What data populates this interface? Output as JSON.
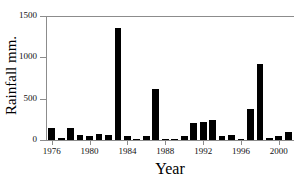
{
  "chart_data": {
    "type": "bar",
    "title": "",
    "xlabel": "Year",
    "ylabel": "Rainfall mm.",
    "xlim": [
      1975.4,
      2001.6
    ],
    "ylim": [
      0,
      1500
    ],
    "grid": false,
    "legend": null,
    "yticks": [
      0,
      500,
      1000,
      1500
    ],
    "ytick_labels": [
      "0",
      "500",
      "1000",
      "1500"
    ],
    "xticks": [
      1976,
      1980,
      1984,
      1988,
      1992,
      1996,
      2000
    ],
    "xtick_labels": [
      "1976",
      "1980",
      "1984",
      "1988",
      "1992",
      "1996",
      "2000"
    ],
    "bar_color": "#000000",
    "axis_color": "#8c8c8c",
    "categories": [
      1976,
      1977,
      1978,
      1979,
      1980,
      1981,
      1982,
      1983,
      1984,
      1985,
      1986,
      1987,
      1988,
      1989,
      1990,
      1991,
      1992,
      1993,
      1994,
      1995,
      1996,
      1997,
      1998,
      1999,
      2000,
      2001
    ],
    "values": [
      145,
      25,
      150,
      65,
      45,
      70,
      55,
      1360,
      45,
      8,
      45,
      620,
      6,
      8,
      50,
      205,
      215,
      240,
      50,
      65,
      5,
      370,
      920,
      30,
      45,
      95
    ]
  }
}
